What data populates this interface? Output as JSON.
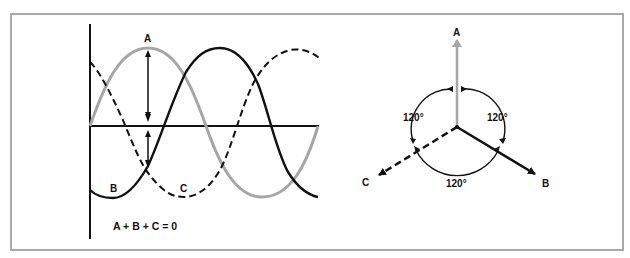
{
  "figure": {
    "waveform": {
      "labels": {
        "a": "A",
        "b": "B",
        "c": "C"
      },
      "equation": "A + B + C = 0",
      "phases": [
        {
          "name": "A",
          "style": "solid",
          "color": "#a6a6a6",
          "phase_deg": 0
        },
        {
          "name": "B",
          "style": "solid",
          "color": "#111111",
          "phase_deg": -120
        },
        {
          "name": "C",
          "style": "dashed",
          "color": "#111111",
          "phase_deg": 120
        }
      ]
    },
    "phasor": {
      "labels": {
        "a": "A",
        "b": "B",
        "c": "C"
      },
      "angles": [
        "120°",
        "120°",
        "120°"
      ],
      "colors": {
        "a": "#a6a6a6",
        "b": "#111111",
        "c": "#111111"
      }
    }
  }
}
